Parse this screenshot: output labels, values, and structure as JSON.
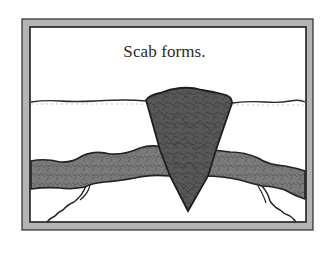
{
  "diagram": {
    "caption": "Scab forms.",
    "elements": {
      "frame": "picture-frame-border",
      "skin_surface": "skin-surface-line",
      "scab": "scab-wedge",
      "blood_vessel": "blood-vessel",
      "vessel_branches": [
        "left-capillary-branch",
        "right-capillary-branch"
      ]
    },
    "colors": {
      "frame_fill": "#b4b4b4",
      "frame_stroke": "#2a2a2a",
      "scab_fill": "#5a5a5a",
      "vessel_fill": "#7c7c7c",
      "outline": "#222222",
      "background": "#ffffff"
    }
  }
}
